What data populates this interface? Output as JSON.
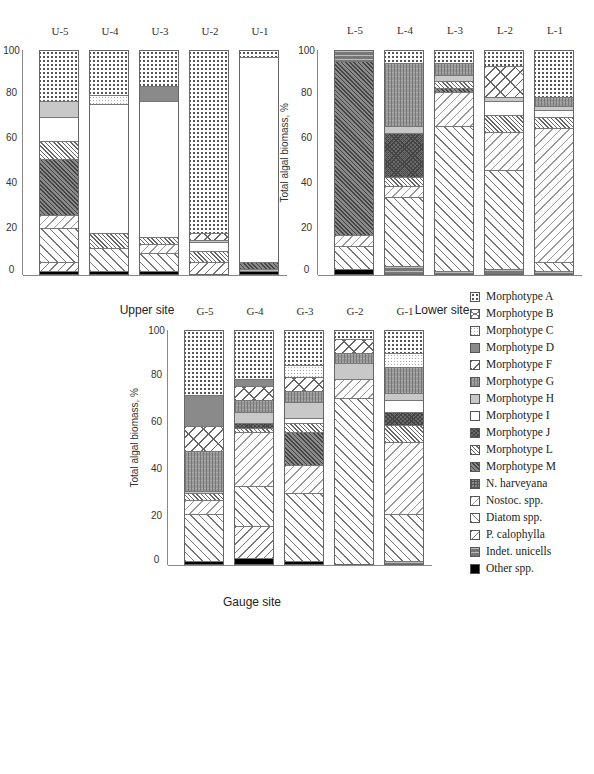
{
  "chart_data": {
    "type": "bar",
    "stacked": true,
    "orientation": "horizontal (figure rotated 90°)",
    "ylabel": "Total algal biomass, %",
    "ylim": [
      0,
      100
    ],
    "yticks": [
      "0",
      "20",
      "40",
      "60",
      "80",
      "100"
    ],
    "legend": [
      {
        "key": "A",
        "label": "Morphotype A"
      },
      {
        "key": "B",
        "label": "Morphotype B"
      },
      {
        "key": "C",
        "label": "Morphotype C"
      },
      {
        "key": "D",
        "label": "Morphotype D"
      },
      {
        "key": "F",
        "label": "Morphotype F"
      },
      {
        "key": "G",
        "label": "Morphotype G"
      },
      {
        "key": "H",
        "label": "Morphotype H"
      },
      {
        "key": "I",
        "label": "Morphotype I"
      },
      {
        "key": "J",
        "label": "Morphotype J"
      },
      {
        "key": "L",
        "label": "Morphotype L"
      },
      {
        "key": "M",
        "label": "Morphotype M"
      },
      {
        "key": "N",
        "label": "N. harveyana"
      },
      {
        "key": "Nostoc",
        "label": "Nostoc. spp."
      },
      {
        "key": "Diatom",
        "label": "Diatom spp."
      },
      {
        "key": "Pcalo",
        "label": "P. calophylla"
      },
      {
        "key": "Indet",
        "label": "Indet. unicells"
      },
      {
        "key": "Other",
        "label": "Other spp."
      }
    ],
    "panels": [
      {
        "title": "Upper site",
        "bars": [
          {
            "label": "U-1",
            "segments": [
              [
                "A",
                3
              ],
              [
                "I",
                92
              ],
              [
                "M",
                3
              ],
              [
                "Indet",
                1
              ],
              [
                "Other",
                1
              ]
            ]
          },
          {
            "label": "U-2",
            "segments": [
              [
                "A",
                82
              ],
              [
                "F",
                3
              ],
              [
                "H",
                1
              ],
              [
                "I",
                4
              ],
              [
                "L",
                5
              ],
              [
                "Pcalo",
                5
              ]
            ]
          },
          {
            "label": "U-3",
            "segments": [
              [
                "A",
                16
              ],
              [
                "D",
                7
              ],
              [
                "I",
                61
              ],
              [
                "L",
                3
              ],
              [
                "Nostoc",
                4
              ],
              [
                "Diatom",
                8
              ],
              [
                "Other",
                1
              ]
            ]
          },
          {
            "label": "U-4",
            "segments": [
              [
                "A",
                20
              ],
              [
                "C",
                4
              ],
              [
                "I",
                58
              ],
              [
                "L",
                7
              ],
              [
                "Diatom",
                10
              ],
              [
                "Other",
                1
              ]
            ]
          },
          {
            "label": "U-5",
            "segments": [
              [
                "A",
                23
              ],
              [
                "H",
                7
              ],
              [
                "I",
                11
              ],
              [
                "L",
                8
              ],
              [
                "M",
                25
              ],
              [
                "Nostoc",
                6
              ],
              [
                "Diatom",
                15
              ],
              [
                "Pcalo",
                4
              ],
              [
                "Other",
                1
              ]
            ]
          }
        ]
      },
      {
        "title": "Lower site",
        "bars": [
          {
            "label": "L-1",
            "segments": [
              [
                "A",
                21
              ],
              [
                "G",
                4
              ],
              [
                "H",
                2
              ],
              [
                "I",
                3
              ],
              [
                "L",
                5
              ],
              [
                "Nostoc",
                60
              ],
              [
                "Diatom",
                4
              ],
              [
                "Indet",
                1
              ]
            ]
          },
          {
            "label": "L-2",
            "segments": [
              [
                "A",
                7
              ],
              [
                "F",
                14
              ],
              [
                "H",
                2
              ],
              [
                "I",
                6
              ],
              [
                "L",
                8
              ],
              [
                "Nostoc",
                17
              ],
              [
                "Diatom",
                44
              ],
              [
                "Indet",
                2
              ]
            ]
          },
          {
            "label": "L-3",
            "segments": [
              [
                "A",
                6
              ],
              [
                "G",
                5
              ],
              [
                "H",
                3
              ],
              [
                "L",
                3
              ],
              [
                "M",
                2
              ],
              [
                "Nostoc",
                15
              ],
              [
                "Diatom",
                65
              ],
              [
                "Indet",
                1
              ]
            ]
          },
          {
            "label": "L-4",
            "segments": [
              [
                "A",
                6
              ],
              [
                "G",
                28
              ],
              [
                "H",
                3
              ],
              [
                "J",
                20
              ],
              [
                "L",
                4
              ],
              [
                "Nostoc",
                5
              ],
              [
                "Diatom",
                31
              ],
              [
                "Indet",
                3
              ]
            ]
          },
          {
            "label": "L-5",
            "segments": [
              [
                "Indet",
                5
              ],
              [
                "M",
                78
              ],
              [
                "Nostoc",
                5
              ],
              [
                "Diatom",
                10
              ],
              [
                "Other",
                2
              ]
            ]
          }
        ]
      },
      {
        "title": "Gauge site",
        "bars": [
          {
            "label": "G-1",
            "segments": [
              [
                "A",
                10
              ],
              [
                "C",
                6
              ],
              [
                "G",
                11
              ],
              [
                "H",
                3
              ],
              [
                "I",
                5
              ],
              [
                "J",
                6
              ],
              [
                "L",
                7
              ],
              [
                "Nostoc",
                31
              ],
              [
                "Diatom",
                20
              ],
              [
                "Indet",
                1
              ]
            ]
          },
          {
            "label": "G-2",
            "segments": [
              [
                "A",
                4
              ],
              [
                "F",
                6
              ],
              [
                "G",
                4
              ],
              [
                "H",
                7
              ],
              [
                "Nostoc",
                8
              ],
              [
                "Diatom",
                71
              ]
            ]
          },
          {
            "label": "G-3",
            "segments": [
              [
                "A",
                15
              ],
              [
                "C",
                5
              ],
              [
                "F",
                6
              ],
              [
                "G",
                5
              ],
              [
                "H",
                7
              ],
              [
                "I",
                2
              ],
              [
                "L",
                4
              ],
              [
                "M",
                14
              ],
              [
                "Nostoc",
                12
              ],
              [
                "Diatom",
                29
              ],
              [
                "Other",
                1
              ]
            ]
          },
          {
            "label": "G-4",
            "segments": [
              [
                "A",
                21
              ],
              [
                "D",
                3
              ],
              [
                "F",
                6
              ],
              [
                "G",
                5
              ],
              [
                "H",
                5
              ],
              [
                "J",
                2
              ],
              [
                "L",
                2
              ],
              [
                "Nostoc",
                23
              ],
              [
                "Diatom",
                17
              ],
              [
                "Pcalo",
                14
              ],
              [
                "Other",
                2
              ]
            ]
          },
          {
            "label": "G-5",
            "segments": [
              [
                "A",
                28
              ],
              [
                "D",
                13
              ],
              [
                "F",
                11
              ],
              [
                "G",
                17
              ],
              [
                "H",
                1
              ],
              [
                "L",
                3
              ],
              [
                "Nostoc",
                6
              ],
              [
                "Diatom",
                20
              ],
              [
                "Other",
                1
              ]
            ]
          }
        ]
      }
    ]
  }
}
